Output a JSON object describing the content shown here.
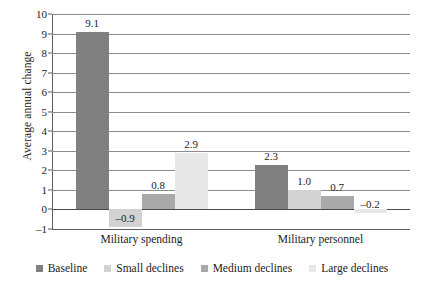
{
  "chart_data": {
    "type": "bar",
    "title": "",
    "subtitle": "",
    "xlabel": "",
    "ylabel": "Average annual change",
    "categories": [
      "Military spending",
      "Military personnel"
    ],
    "series": [
      {
        "name": "Baseline",
        "color": "#808080",
        "values": [
          9.1,
          2.3
        ],
        "labels": [
          "9.1",
          "2.3"
        ]
      },
      {
        "name": "Small declines",
        "color": "#d2d2d2",
        "values": [
          -0.9,
          1.0
        ],
        "labels": [
          "–0.9",
          "1.0"
        ]
      },
      {
        "name": "Medium declines",
        "color": "#a9a9a9",
        "values": [
          0.8,
          0.7
        ],
        "labels": [
          "0.8",
          "0.7"
        ]
      },
      {
        "name": "Large declines",
        "color": "#e8e8e8",
        "values": [
          2.9,
          -0.2
        ],
        "labels": [
          "2.9",
          "–0.2"
        ]
      }
    ],
    "ylim": [
      -1,
      10
    ],
    "yticks": [
      10,
      9,
      8,
      7,
      6,
      5,
      4,
      3,
      2,
      1,
      0,
      -1
    ],
    "ytick_labels": [
      "10",
      "9",
      "8",
      "7",
      "6",
      "5",
      "4",
      "3",
      "2",
      "1",
      "0",
      "–1"
    ],
    "grid": true,
    "grid_axis": "y",
    "legend_position": "bottom",
    "zero_line": 0
  }
}
